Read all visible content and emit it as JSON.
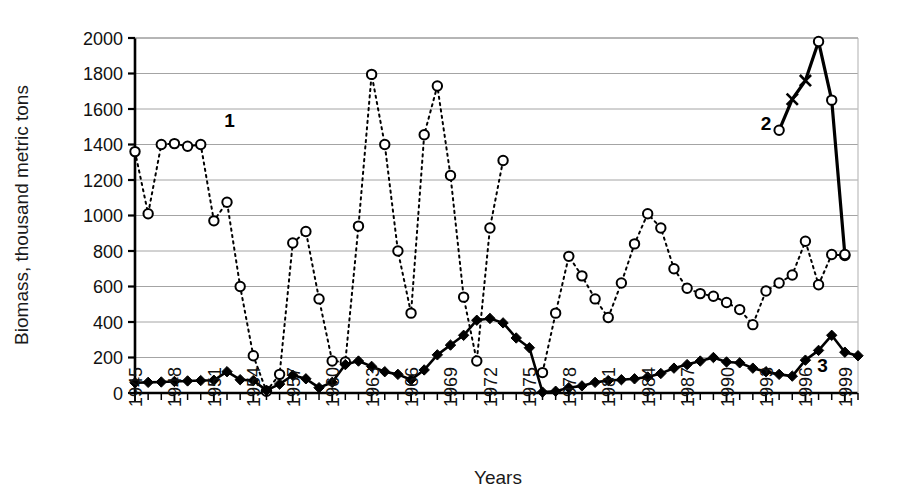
{
  "chart_data": {
    "type": "line",
    "title": "",
    "xlabel": "Years",
    "ylabel": "Biomass,  thousand metric tons",
    "xlim": [
      1945,
      2000
    ],
    "ylim": [
      0,
      2000
    ],
    "yticks": [
      0,
      200,
      400,
      600,
      800,
      1000,
      1200,
      1400,
      1600,
      1800,
      2000
    ],
    "xticks": [
      1945,
      1948,
      1951,
      1954,
      1957,
      1960,
      1963,
      1966,
      1969,
      1972,
      1975,
      1978,
      1981,
      1984,
      1987,
      1990,
      1993,
      1996,
      1999
    ],
    "xtick_labels": [
      "1945",
      "1948",
      "1951",
      "1954",
      "1957",
      "1960",
      "1963",
      "1966",
      "1969",
      "1972",
      "1975",
      "1978",
      "1981",
      "1984",
      "1987",
      "1990",
      "1993",
      "1996",
      "1999"
    ],
    "ytick_labels": [
      "0",
      "200",
      "400",
      "600",
      "800",
      "1000",
      "1200",
      "1400",
      "1600",
      "1800",
      "2000"
    ],
    "grid": true,
    "legend_position": "inline-annotations",
    "series": [
      {
        "name": "1",
        "label": "1",
        "marker": "open-circle",
        "line_style": "dotted",
        "color": "#000000",
        "annotation": {
          "text": "1",
          "x": 1952.2,
          "y": 1500
        },
        "x": [
          1945,
          1946,
          1947,
          1948,
          1949,
          1950,
          1951,
          1952,
          1953,
          1954,
          1955,
          1956,
          1957,
          1958,
          1959,
          1960,
          1961,
          1962,
          1963,
          1964,
          1965,
          1966,
          1967,
          1968,
          1969,
          1970,
          1971,
          1972,
          1973,
          1974,
          1975,
          1976,
          1977,
          1978,
          1979,
          1980,
          1981,
          1982,
          1983,
          1984,
          1985,
          1986,
          1987,
          1988,
          1989,
          1990,
          1991,
          1992,
          1993,
          1994,
          1995,
          1996,
          1997,
          1998,
          1999,
          2000
        ],
        "y": [
          1360,
          1010,
          1400,
          1405,
          1390,
          1400,
          970,
          1075,
          600,
          210,
          10,
          105,
          845,
          910,
          530,
          180,
          175,
          940,
          1795,
          1400,
          800,
          450,
          1455,
          1730,
          1225,
          540,
          180,
          930,
          1310,
          null,
          null,
          115,
          450,
          770,
          660,
          530,
          425,
          620,
          840,
          1010,
          930,
          700,
          590,
          560,
          545,
          510,
          470,
          385,
          575,
          620,
          665,
          855,
          610,
          780,
          775,
          null
        ]
      },
      {
        "name": "2",
        "label": "2",
        "marker": "mixed open-circle and x",
        "line_style": "solid",
        "color": "#000000",
        "annotation": {
          "text": "2",
          "x": 1993.0,
          "y": 1480
        },
        "x": [
          1994,
          1995,
          1996,
          1997,
          1998,
          1999
        ],
        "y": [
          1480,
          1655,
          1760,
          1980,
          1650,
          780
        ],
        "markers": [
          "open-circle",
          "x",
          "x",
          "open-circle",
          "open-circle",
          "open-circle"
        ]
      },
      {
        "name": "3",
        "label": "3",
        "marker": "filled-diamond",
        "line_style": "solid",
        "color": "#000000",
        "annotation": {
          "text": "3",
          "x": 1997.3,
          "y": 120
        },
        "x": [
          1945,
          1946,
          1947,
          1948,
          1949,
          1950,
          1951,
          1952,
          1953,
          1954,
          1955,
          1956,
          1957,
          1958,
          1959,
          1960,
          1961,
          1962,
          1963,
          1964,
          1965,
          1966,
          1967,
          1968,
          1969,
          1970,
          1971,
          1972,
          1973,
          1974,
          1975,
          1976,
          1977,
          1978,
          1979,
          1980,
          1981,
          1982,
          1983,
          1984,
          1985,
          1986,
          1987,
          1988,
          1989,
          1990,
          1991,
          1992,
          1993,
          1994,
          1995,
          1996,
          1997,
          1998,
          1999,
          2000
        ],
        "y": [
          58,
          60,
          62,
          65,
          68,
          70,
          72,
          120,
          75,
          70,
          15,
          50,
          100,
          80,
          30,
          60,
          160,
          180,
          150,
          120,
          105,
          75,
          130,
          215,
          270,
          325,
          410,
          420,
          395,
          310,
          255,
          5,
          10,
          30,
          40,
          60,
          70,
          75,
          80,
          90,
          110,
          140,
          160,
          180,
          200,
          175,
          170,
          140,
          120,
          105,
          95,
          185,
          240,
          325,
          230,
          210
        ]
      }
    ]
  },
  "axis": {
    "y_title": "Biomass,  thousand metric tons",
    "x_title": "Years"
  },
  "annotations": [
    {
      "name": "series-1-label",
      "text": "1"
    },
    {
      "name": "series-2-label",
      "text": "2"
    },
    {
      "name": "series-3-label",
      "text": "3"
    }
  ]
}
